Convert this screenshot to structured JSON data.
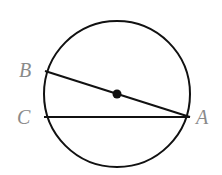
{
  "diagram": {
    "type": "circle-chords",
    "circle": {
      "cx": 117,
      "cy": 94,
      "r": 73
    },
    "points": [
      {
        "name": "A",
        "x": 190,
        "y": 117,
        "label_x": 197,
        "label_y": 124
      },
      {
        "name": "B",
        "x": 45,
        "y": 71,
        "label_x": 19,
        "label_y": 77
      },
      {
        "name": "C",
        "x": 44,
        "y": 117,
        "label_x": 17,
        "label_y": 124
      }
    ],
    "center_dot": {
      "x": 117,
      "y": 94
    },
    "segments": [
      {
        "from": "B",
        "to": "A",
        "passes_through_center": true
      },
      {
        "from": "C",
        "to": "A",
        "passes_through_center": false
      }
    ],
    "labels": {
      "A": "A",
      "B": "B",
      "C": "C"
    },
    "colors": {
      "stroke": "#111111",
      "label": "#8a8a8a"
    }
  }
}
